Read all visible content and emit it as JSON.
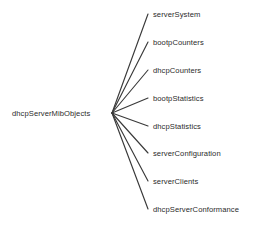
{
  "diagram": {
    "type": "tree",
    "line_color": "#3a3a3a",
    "text_color": "#2b2b2b",
    "background_color": "#ffffff",
    "root": {
      "label": "dhcpServerMibObjects",
      "x": 12,
      "y": 109,
      "hub_x": 112,
      "hub_y": 113
    },
    "children": [
      {
        "label": "serverSystem",
        "x": 153,
        "y": 10,
        "edge_end_x": 148,
        "edge_end_y": 14
      },
      {
        "label": "bootpCounters",
        "x": 153,
        "y": 38,
        "edge_end_x": 148,
        "edge_end_y": 42
      },
      {
        "label": "dhcpCounters",
        "x": 153,
        "y": 66,
        "edge_end_x": 148,
        "edge_end_y": 70
      },
      {
        "label": "bootpStatistics",
        "x": 153,
        "y": 94,
        "edge_end_x": 148,
        "edge_end_y": 98
      },
      {
        "label": "dhcpStatistics",
        "x": 153,
        "y": 122,
        "edge_end_x": 148,
        "edge_end_y": 126
      },
      {
        "label": "serverConfiguration",
        "x": 153,
        "y": 149,
        "edge_end_x": 148,
        "edge_end_y": 153
      },
      {
        "label": "serverClients",
        "x": 153,
        "y": 177,
        "edge_end_x": 148,
        "edge_end_y": 181
      },
      {
        "label": "dhcpServerConformance",
        "x": 153,
        "y": 205,
        "edge_end_x": 148,
        "edge_end_y": 209
      }
    ]
  }
}
